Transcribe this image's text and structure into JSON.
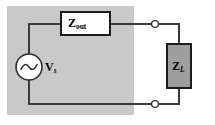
{
  "figure": {
    "type": "circuit-schematic",
    "background_color": "#ffffff",
    "shaded_region_color": "#c9c9c9",
    "wire_color": "#3a3a3a"
  },
  "labels": {
    "source": {
      "symbol": "V",
      "subscript": "s"
    },
    "output_impedance": {
      "symbol": "Z",
      "subscript": "out"
    },
    "load_impedance": {
      "symbol": "Z",
      "subscript": "L"
    }
  },
  "components": {
    "ac_source": {
      "kind": "ac-voltage-source",
      "fill": "#ffffff"
    },
    "zout_box": {
      "kind": "impedance-block",
      "fill": "#ffffff",
      "border": "#1c1c1c"
    },
    "zl_box": {
      "kind": "impedance-block",
      "fill": "#9e9e9e",
      "border": "#1c1c1c"
    },
    "terminals": {
      "kind": "open-terminal-node",
      "count": 2,
      "fill": "#ffffff"
    }
  }
}
